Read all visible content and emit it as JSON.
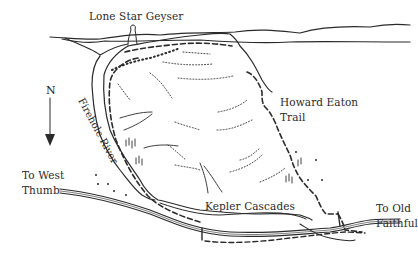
{
  "map": {
    "labels": {
      "geyser": "Lone Star Geyser",
      "trail_line1": "Howard Eaton",
      "trail_line2": "Trail",
      "river": "Firehole River",
      "cascades": "Kepler Cascades",
      "west_line1": "To West",
      "west_line2": "Thumb",
      "old_line1": "To Old",
      "old_line2": "Faithful"
    },
    "compass": {
      "letter": "N",
      "icon": "north-arrow-icon",
      "direction": "down"
    },
    "colors": {
      "ink": "#2a2a2a",
      "background": "#ffffff"
    }
  }
}
